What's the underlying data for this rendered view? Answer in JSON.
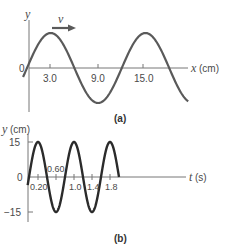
{
  "panel_a": {
    "caption": "(a)",
    "y_label": "y",
    "x_label_var": "x",
    "x_label_unit": "(cm)",
    "origin_label": "0",
    "velocity_label": "v",
    "x_ticks": [
      "3.0",
      "9.0",
      "15.0"
    ],
    "wave_color": "#5a5a5a",
    "arrow_color": "#5a5a5a"
  },
  "panel_b": {
    "caption": "(b)",
    "y_label_var": "y",
    "y_label_unit": "(cm)",
    "x_label_var": "t",
    "x_label_unit": "(s)",
    "origin_label": "0",
    "y_ticks": [
      "15",
      "−15"
    ],
    "t_ticks_below": [
      "0.20",
      "1.0",
      "1.4",
      "1.8"
    ],
    "t_tick_above": "0.60",
    "wave_color": "#2b2b2b"
  },
  "chart_data": [
    {
      "type": "line",
      "title": "(a) Displacement vs position",
      "xlabel": "x (cm)",
      "ylabel": "y",
      "x_ticks": [
        3.0,
        9.0,
        15.0
      ],
      "function": "y = A sin(2*pi*x/12)",
      "wavelength_cm": 12,
      "x_range": [
        -0.5,
        20.5
      ],
      "annotation": "arrow labeled v pointing +x (wave moving right)"
    },
    {
      "type": "line",
      "title": "(b) Displacement vs time",
      "xlabel": "t (s)",
      "ylabel": "y (cm)",
      "amplitude_cm": 15,
      "period_s": 0.8,
      "y_ticks": [
        15,
        -15
      ],
      "t_ticks": [
        0.2,
        0.6,
        1.0,
        1.4,
        1.8
      ],
      "function": "y = 15 sin(2*pi*t/0.8)",
      "t_range": [
        -0.03,
        2.0
      ],
      "ylim": [
        -15,
        15
      ]
    }
  ]
}
